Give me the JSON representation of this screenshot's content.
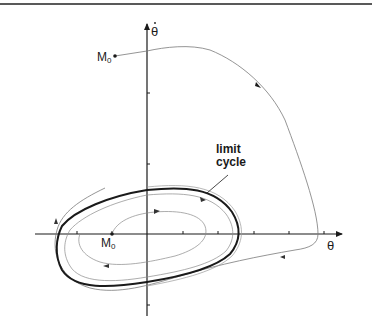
{
  "figure": {
    "type": "phase-portrait",
    "x_axis_label": "θ",
    "y_axis_label": "θ̇",
    "y_axis_label_base": "θ",
    "limit_cycle_label_line1": "limit",
    "limit_cycle_label_line2": "cycle",
    "outer_start_label": "M",
    "outer_start_subscript": "0",
    "inner_start_label": "M",
    "inner_start_subscript": "0"
  },
  "colors": {
    "axis": "#1a1a1a",
    "limit_cycle": "#1a1a1a",
    "trajectory": "#7a7a7a",
    "top_rule": "#222222"
  }
}
